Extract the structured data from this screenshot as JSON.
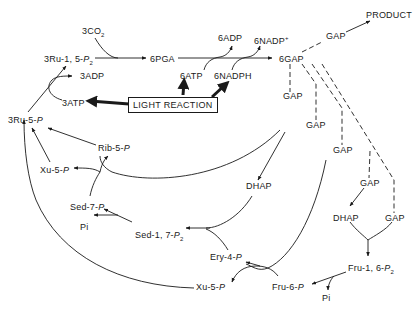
{
  "diagram": {
    "colors": {
      "ink": "#1a1a1a",
      "background": "#ffffff"
    },
    "nodes": {
      "co2": {
        "coef": "3CO",
        "sub": "2"
      },
      "rubp": {
        "text": "3Ru-1, 5-",
        "p": "P",
        "sub": "2"
      },
      "pga": {
        "text": "6PGA"
      },
      "atp6": {
        "text": "6ATP"
      },
      "adp6": {
        "text": "6ADP"
      },
      "nadph6": {
        "text": "6NADPH"
      },
      "nadp6": {
        "text": "6NADP",
        "sup": "+"
      },
      "gap6": {
        "text": "6GAP"
      },
      "gap_product": {
        "text": "GAP"
      },
      "product": {
        "text": "PRODUCT"
      },
      "adp3": {
        "text": "3ADP"
      },
      "atp3": {
        "text": "3ATP"
      },
      "light_reaction": {
        "text": "LIGHT REACTION"
      },
      "ru5p": {
        "text": "3Ru-5-",
        "p": "P"
      },
      "rib5p": {
        "text": "Rib-5-",
        "p": "P"
      },
      "xu5p_top": {
        "text": "Xu-5-",
        "p": "P"
      },
      "sed7p": {
        "text": "Sed-7-",
        "p": "P"
      },
      "pi_left": {
        "text": "Pi"
      },
      "sed17p2": {
        "text": "Sed-1, 7-",
        "p": "P",
        "sub": "2"
      },
      "gap_a": {
        "text": "GAP"
      },
      "gap_b": {
        "text": "GAP"
      },
      "gap_c": {
        "text": "GAP"
      },
      "gap_d": {
        "text": "GAP"
      },
      "gap_e": {
        "text": "GAP"
      },
      "dhap_mid": {
        "text": "DHAP"
      },
      "dhap_right": {
        "text": "DHAP"
      },
      "ery4p": {
        "text": "Ery-4-",
        "p": "P"
      },
      "xu5p_bottom": {
        "text": "Xu-5-",
        "p": "P"
      },
      "fru6p": {
        "text": "Fru-6-",
        "p": "P"
      },
      "fru16p2": {
        "text": "Fru-1, 6-",
        "p": "P",
        "sub": "2"
      },
      "pi_right": {
        "text": "Pi"
      }
    }
  }
}
